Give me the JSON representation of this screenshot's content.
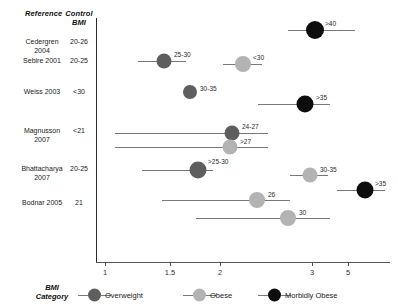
{
  "table_headers": {
    "reference": "Reference",
    "control_line1": "Control",
    "control_line2": "BMI"
  },
  "studies": [
    {
      "name_line1": "Cedergren",
      "name_line2": "2004",
      "control_bmi": "20-26"
    },
    {
      "name_line1": "Sebire 2001",
      "name_line2": "",
      "control_bmi": "20-25"
    },
    {
      "name_line1": "Weiss 2003",
      "name_line2": "",
      "control_bmi": "<30"
    },
    {
      "name_line1": "Magnusson",
      "name_line2": "2007",
      "control_bmi": "<21"
    },
    {
      "name_line1": "Bhattacharya",
      "name_line2": "2007",
      "control_bmi": "20-25"
    },
    {
      "name_line1": "Bodnar 2005",
      "name_line2": "",
      "control_bmi": "21"
    }
  ],
  "legend": {
    "title_line1": "BMI",
    "title_line2": "Category",
    "items": [
      {
        "label": "Overweight",
        "category": "overweight",
        "color": "#5e5e5e"
      },
      {
        "label": "Obese",
        "category": "obese",
        "color": "#b3b3b3"
      },
      {
        "label": "Morbidly Obese",
        "category": "morbid",
        "color": "#0d0d0d"
      }
    ]
  },
  "chart_data": {
    "type": "scatter",
    "title": "",
    "xlabel": "",
    "ylabel": "",
    "scale": "log",
    "xlim": [
      0.85,
      6.0
    ],
    "reference_line": 1,
    "grid": false,
    "legend_position": "bottom",
    "xticks": [
      1,
      1.5,
      2,
      3,
      5
    ],
    "xtick_labels": [
      "1",
      "1.5",
      "2",
      "3",
      "5"
    ],
    "categories": [
      "Overweight",
      "Obese",
      "Morbidly Obese"
    ],
    "category_colors": {
      "Overweight": "#5e5e5e",
      "Obese": "#b3b3b3",
      "Morbidly Obese": "#0d0d0d"
    },
    "points": [
      {
        "study": "Cedergren 2004",
        "label": ">40",
        "category": "Morbidly Obese",
        "value": 3.2,
        "ci_low": 2.5,
        "ci_high": 4.3
      },
      {
        "study": "Sebire 2001",
        "label": "25-30",
        "category": "Overweight",
        "value": 1.35,
        "ci_low": 1.18,
        "ci_high": 1.55
      },
      {
        "study": "Sebire 2001",
        "label": "<30",
        "category": "Obese",
        "value": 1.9,
        "ci_low": 1.62,
        "ci_high": 2.25
      },
      {
        "study": "Weiss 2003",
        "label": "30-35",
        "category": "Overweight",
        "value": 1.95,
        "ci_low": 1.95,
        "ci_high": 1.95
      },
      {
        "study": "Weiss 2003",
        "label": ">35",
        "category": "Morbidly Obese",
        "value": 3.0,
        "ci_low": 1.82,
        "ci_high": 3.55
      },
      {
        "study": "Magnusson 2007",
        "label": "24-27",
        "category": "Overweight",
        "value": 2.25,
        "ci_low": 1.02,
        "ci_high": 2.85
      },
      {
        "study": "Magnusson 2007",
        "label": ">27",
        "category": "Obese",
        "value": 2.2,
        "ci_low": 1.02,
        "ci_high": 2.85
      },
      {
        "study": "Bhattacharya 2007",
        "label": ">25-30",
        "category": "Overweight",
        "value": 2.0,
        "ci_low": 1.12,
        "ci_high": 2.4
      },
      {
        "study": "Bhattacharya 2007",
        "label": "30-35",
        "category": "Obese",
        "value": 3.05,
        "ci_low": 2.5,
        "ci_high": 3.45
      },
      {
        "study": "Bhattacharya 2007",
        "label": ">35",
        "category": "Morbidly Obese",
        "value": 3.85,
        "ci_low": 3.05,
        "ci_high": 4.6
      },
      {
        "study": "Bodnar 2005",
        "label": "26",
        "category": "Obese",
        "value": 2.55,
        "ci_low": 1.42,
        "ci_high": 3.25
      },
      {
        "study": "Bodnar 2005",
        "label": "30",
        "category": "Obese",
        "value": 2.95,
        "ci_low": 1.72,
        "ci_high": 3.9
      }
    ]
  },
  "geometry": {
    "axis_y": 262,
    "axis_x_left": 96,
    "axis_x_right": 390,
    "vline_top": 18,
    "vline_bottom": 262,
    "rows": [
      {
        "name_top": 38,
        "text_left": 22,
        "text_width": 40
      },
      {
        "name_top": 57,
        "text_left": 22,
        "text_width": 40
      },
      {
        "name_top": 88,
        "text_left": 22,
        "text_width": 40
      },
      {
        "name_top": 127,
        "text_left": 22,
        "text_width": 40
      },
      {
        "name_top": 165,
        "text_left": 18,
        "text_width": 48
      },
      {
        "name_top": 199,
        "text_left": 22,
        "text_width": 40
      }
    ],
    "point_rows": [
      {
        "label": ">40",
        "y": 30,
        "px": 315,
        "ci_x1": 288,
        "ci_x2": 355,
        "r": 9.0,
        "lx": 325,
        "ly": 23
      },
      {
        "label": "25-30",
        "y": 61,
        "px": 164,
        "ci_x1": 138,
        "ci_x2": 186,
        "r": 7.5,
        "lx": 174,
        "ly": 54
      },
      {
        "label": "<30",
        "y": 64,
        "px": 243,
        "ci_x1": 223,
        "ci_x2": 262,
        "r": 8.0,
        "lx": 253,
        "ly": 57
      },
      {
        "label": "30-35",
        "y": 92,
        "px": 190,
        "ci_x1": 190,
        "ci_x2": 190,
        "r": 7.0,
        "lx": 200,
        "ly": 88
      },
      {
        "label": ">35",
        "y": 104,
        "px": 305,
        "ci_x1": 258,
        "ci_x2": 330,
        "r": 8.5,
        "lx": 316,
        "ly": 97
      },
      {
        "label": "24-27",
        "y": 133,
        "px": 232,
        "ci_x1": 115,
        "ci_x2": 268,
        "r": 7.5,
        "lx": 242,
        "ly": 126
      },
      {
        "label": ">27",
        "y": 147,
        "px": 230,
        "ci_x1": 115,
        "ci_x2": 268,
        "r": 7.5,
        "lx": 240,
        "ly": 141
      },
      {
        "label": ">25-30",
        "y": 170,
        "px": 198,
        "ci_x1": 142,
        "ci_x2": 213,
        "r": 8.5,
        "lx": 208,
        "ly": 161
      },
      {
        "label": "30-35",
        "y": 175,
        "px": 310,
        "ci_x1": 290,
        "ci_x2": 328,
        "r": 7.5,
        "lx": 320,
        "ly": 169
      },
      {
        "label": ">35",
        "y": 190,
        "px": 365,
        "ci_x1": 337,
        "ci_x2": 385,
        "r": 8.5,
        "lx": 375,
        "ly": 183
      },
      {
        "label": "26",
        "y": 200,
        "px": 257,
        "ci_x1": 162,
        "ci_x2": 290,
        "r": 8.0,
        "lx": 268,
        "ly": 194
      },
      {
        "label": "30",
        "y": 218,
        "px": 288,
        "ci_x1": 196,
        "ci_x2": 330,
        "r": 8.0,
        "lx": 299,
        "ly": 212
      }
    ],
    "xticks_px": [
      {
        "label": "1",
        "x": 105
      },
      {
        "label": "1.5",
        "x": 170
      },
      {
        "label": "2",
        "x": 220
      },
      {
        "label": "3",
        "x": 312
      },
      {
        "label": "5",
        "x": 348
      }
    ],
    "legend_items_px": [
      {
        "dash_x": 78,
        "dot_x": 88,
        "text_x": 105
      },
      {
        "dash_x": 183,
        "dot_x": 193,
        "text_x": 210
      },
      {
        "dash_x": 258,
        "dot_x": 268,
        "text_x": 285
      }
    ]
  }
}
